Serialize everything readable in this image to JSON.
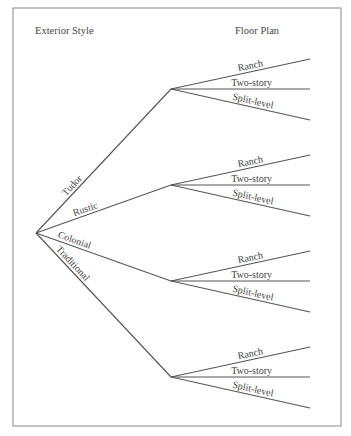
{
  "headers": {
    "left": "Exterior Style",
    "right": "Floor Plan"
  },
  "tree": {
    "root": "",
    "branches": [
      {
        "label": "Tudor",
        "leaves": [
          "Ranch",
          "Two-story",
          "Split-level"
        ]
      },
      {
        "label": "Rustic",
        "leaves": [
          "Ranch",
          "Two-story",
          "Split-level"
        ]
      },
      {
        "label": "Colonial",
        "leaves": [
          "Ranch",
          "Two-story",
          "Split-level"
        ]
      },
      {
        "label": "Traditional",
        "leaves": [
          "Ranch",
          "Two-story",
          "Split-level"
        ]
      }
    ]
  }
}
